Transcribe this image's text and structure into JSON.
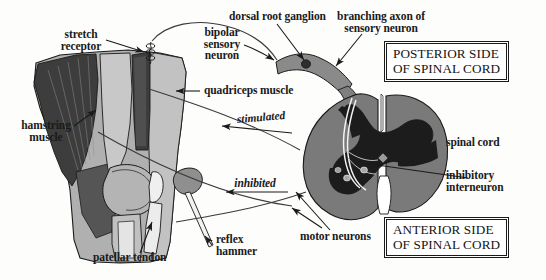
{
  "diagram": {
    "background_color": "#fdfdfc",
    "palette": {
      "outline": "#1a1a1a",
      "skin_light": "#b8b8b8",
      "skin_mid": "#9a9a9a",
      "muscle_dark": "#3a3a3a",
      "muscle_mid": "#6e6e6e",
      "bone_light": "#d8d8d8",
      "tendon": "#e6e6e6",
      "cord_gray": "#7a7a7a",
      "cord_matter": "#1c1c1c",
      "root_gray": "#8a8a8a",
      "hammer_gray": "#8f8f8f",
      "label_text": "#1a1a1a"
    }
  },
  "labels": {
    "stretch_receptor": "stretch\nreceptor",
    "bipolar_sensory_neuron": "bipolar\nsensory\nneuron",
    "dorsal_root_ganglion": "dorsal root ganglion",
    "branching_axon": "branching axon of\nsensory neuron",
    "quadriceps_muscle": "quadriceps muscle",
    "hamstring_muscle": "hamstring\nmuscle",
    "spinal_cord": "spinal cord",
    "inhibitory_interneuron": "inhibitory\ninterneuron",
    "motor_neurons": "motor neurons",
    "patellar_tendon": "patellar tendon",
    "reflex_hammer": "reflex\nhammer",
    "stimulated": "stimulated",
    "inhibited": "inhibited"
  },
  "callout_boxes": {
    "posterior": {
      "line1": "POSTERIOR SIDE",
      "line2": "OF SPINAL CORD"
    },
    "anterior": {
      "line1": "ANTERIOR SIDE",
      "line2": "OF SPINAL CORD"
    }
  }
}
